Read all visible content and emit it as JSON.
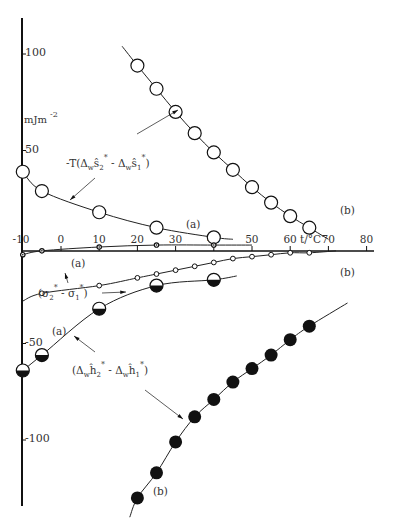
{
  "chart_data": {
    "type": "scatter",
    "title": "",
    "xlabel": "t/°C",
    "ylabel": "mJm-2",
    "xlim": [
      -12,
      82
    ],
    "ylim": [
      -125,
      125
    ],
    "x_ticks": [
      -10,
      0,
      10,
      20,
      30,
      40,
      50,
      60,
      70,
      80
    ],
    "y_ticks": [
      100,
      50,
      -50,
      -100
    ],
    "grid": false,
    "annotations": [
      "-T(ΔwŜ2* - ΔwŜ1*)",
      "(σ2* - σ1*)",
      "(ΔwĤ2* - ΔwĤ1*)",
      "(a)",
      "(b)"
    ],
    "series": [
      {
        "name": "-T(ΔwS2* - ΔwS1*) (b)",
        "marker": "open-circle-large",
        "x": [
          20,
          25,
          30,
          35,
          40,
          45,
          50,
          55,
          60,
          65
        ],
        "y": [
          94,
          82,
          70,
          59,
          49,
          40,
          31,
          23,
          16,
          10
        ]
      },
      {
        "name": "-T(ΔwS2* - ΔwS1*) (a)",
        "marker": "open-circle-large",
        "x": [
          -10,
          -5,
          10,
          25,
          40
        ],
        "y": [
          39,
          29,
          18,
          10,
          5
        ]
      },
      {
        "name": "(σ2* - σ1*) (a)",
        "marker": "small-dot",
        "x": [
          -10,
          -5,
          10,
          25,
          40
        ],
        "y": [
          -4,
          -2,
          0,
          1,
          1
        ]
      },
      {
        "name": "(σ2* - σ1*) (b)",
        "marker": "small-open-circle",
        "x": [
          -5,
          10,
          20,
          25,
          30,
          35,
          40,
          45,
          50,
          55,
          60,
          65
        ],
        "y": [
          -24,
          -20,
          -16,
          -14,
          -12,
          -10,
          -8,
          -6,
          -5,
          -4,
          -3,
          -3
        ]
      },
      {
        "name": "(ΔwH2* - ΔwH1*) (a)",
        "marker": "half-filled-circle",
        "x": [
          -10,
          -5,
          10,
          25,
          40
        ],
        "y": [
          -64,
          -56,
          -32,
          -20,
          -17
        ]
      },
      {
        "name": "(ΔwH2* - ΔwH1*) (b)",
        "marker": "filled-circle",
        "x": [
          20,
          25,
          30,
          35,
          40,
          45,
          50,
          55,
          60,
          65
        ],
        "y": [
          -130,
          -117,
          -101,
          -88,
          -79,
          -70,
          -63,
          -56,
          -48,
          -41
        ]
      }
    ]
  },
  "axis": {
    "y_unit": "mJm",
    "y_unit_exp": "-2",
    "x_unit": "t/°C",
    "y_tick_labels": [
      "100",
      "50",
      "-50",
      "-100"
    ],
    "x_tick_labels": [
      "-10",
      "0",
      "10",
      "20",
      "30",
      "40",
      "50",
      "60",
      "70",
      "80"
    ]
  },
  "labels": {
    "a": "(a)",
    "b": "(b)",
    "entropy_term": "-T(Δ",
    "sigma_term": "(σ",
    "enthalpy_term": "(Δ"
  }
}
